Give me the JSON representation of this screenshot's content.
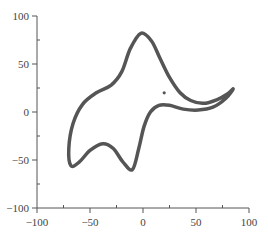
{
  "chart_data": {
    "type": "line",
    "title": "",
    "xlabel": "",
    "ylabel": "",
    "xlim": [
      -100,
      100
    ],
    "ylim": [
      -100,
      100
    ],
    "grid": false,
    "legend": null,
    "x_major_ticks": [
      -100,
      -50,
      0,
      50,
      100
    ],
    "x_minor_ticks": [
      -75,
      -25,
      25,
      75
    ],
    "y_major_ticks": [
      -100,
      -50,
      0,
      50,
      100
    ],
    "y_minor_ticks": [
      -75,
      -25,
      25,
      75
    ],
    "x_tick_labels": [
      "−100",
      "−50",
      "0",
      "50",
      "100"
    ],
    "y_tick_labels": [
      "−100",
      "−50",
      "0",
      "50",
      "100"
    ],
    "series": [
      {
        "name": "closed-curve",
        "color": "#555555",
        "closed": true,
        "points": [
          [
            -2,
            82
          ],
          [
            8,
            74
          ],
          [
            16,
            56
          ],
          [
            25,
            36
          ],
          [
            35,
            20
          ],
          [
            45,
            12
          ],
          [
            57,
            9
          ],
          [
            70,
            13
          ],
          [
            80,
            19
          ],
          [
            85,
            24
          ],
          [
            78,
            14
          ],
          [
            66,
            5
          ],
          [
            52,
            2
          ],
          [
            38,
            3
          ],
          [
            25,
            7
          ],
          [
            15,
            7
          ],
          [
            7,
            0
          ],
          [
            1,
            -15
          ],
          [
            -4,
            -38
          ],
          [
            -10,
            -60
          ],
          [
            -19,
            -52
          ],
          [
            -28,
            -38
          ],
          [
            -38,
            -33
          ],
          [
            -50,
            -40
          ],
          [
            -60,
            -52
          ],
          [
            -68,
            -56
          ],
          [
            -70,
            -38
          ],
          [
            -66,
            -12
          ],
          [
            -57,
            8
          ],
          [
            -44,
            20
          ],
          [
            -30,
            28
          ],
          [
            -20,
            42
          ],
          [
            -12,
            66
          ]
        ]
      },
      {
        "name": "point",
        "color": "#555555",
        "type": "scatter",
        "points": [
          [
            20,
            20
          ]
        ]
      }
    ]
  }
}
